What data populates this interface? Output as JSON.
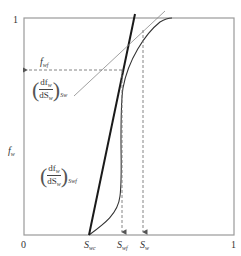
{
  "diagram": {
    "type": "fractional-flow-curve",
    "axes": {
      "x_ticks": [
        {
          "label": "0",
          "value": 0
        },
        {
          "label": "1",
          "value": 1
        }
      ],
      "y_ticks": [
        {
          "label": "1",
          "value": 1
        }
      ],
      "y_label": {
        "main": "f",
        "sub": "w"
      }
    },
    "annotations": {
      "fwf": {
        "main": "f",
        "sub": "wf"
      },
      "tangent_at_sw": {
        "num_main": "df",
        "num_sub": "w",
        "den_main": "dS",
        "den_sub": "w",
        "eval_sub": "Sw"
      },
      "tangent_at_swf": {
        "num_main": "df",
        "num_sub": "w",
        "den_main": "dS",
        "den_sub": "w",
        "eval_sub": "Swf"
      },
      "x_markers": [
        {
          "main": "S",
          "sub": "wc"
        },
        {
          "main": "S",
          "sub": "wf"
        },
        {
          "main": "S",
          "sub": "w"
        }
      ]
    },
    "colors": {
      "frame": "#9a9a9a",
      "curve": "#333333",
      "tangent_thick": "#1a1a1a",
      "tangent_thin": "#888888",
      "dashed": "#777777"
    }
  }
}
